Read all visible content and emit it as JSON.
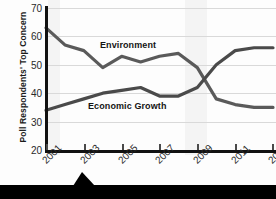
{
  "chart_data": {
    "type": "line",
    "title": "",
    "xlabel": "",
    "ylabel": "Poll Respondents' Top Concern",
    "x": [
      2001,
      2002,
      2003,
      2004,
      2005,
      2006,
      2007,
      2008,
      2009,
      2010,
      2011,
      2012,
      2013
    ],
    "xlim": [
      2001,
      2013
    ],
    "ylim": [
      20,
      70
    ],
    "yticks": [
      70,
      60,
      50,
      40,
      30,
      20
    ],
    "xticks": [
      2001,
      2003,
      2005,
      2007,
      2009,
      2011,
      2013
    ],
    "xtick_labels": [
      "2001",
      "2003",
      "2005",
      "2007",
      "2009",
      "2011",
      "2013"
    ],
    "grid": true,
    "legend": "inline-labels",
    "series": [
      {
        "name": "Environment",
        "color": "#5a5a5a",
        "values": [
          63,
          57,
          55,
          49,
          53,
          51,
          53,
          54,
          49,
          38,
          36,
          35,
          35
        ]
      },
      {
        "name": "Economic Growth",
        "color": "#4a4a4a",
        "values": [
          34,
          36,
          38,
          40,
          41,
          42,
          39,
          39,
          42,
          50,
          55,
          56,
          56
        ]
      }
    ],
    "annotations": [
      {
        "text": "Environment",
        "x": 2005,
        "y": 57
      },
      {
        "text": "Economic Growth",
        "x": 2004,
        "y": 33
      }
    ]
  },
  "axes": {
    "y_title": "Poll Respondents' Top Concern",
    "y_ticks": [
      "70",
      "60",
      "50",
      "40",
      "30",
      "20"
    ],
    "x_ticks": [
      "2001",
      "2003",
      "2005",
      "2007",
      "2009",
      "2011",
      "2013"
    ]
  },
  "labels": {
    "environment": "Environment",
    "economic_growth": "Economic Growth"
  },
  "colors": {
    "environment_line": "#5a5a5a",
    "economic_line": "#4a4a4a",
    "axis": "#111111",
    "grid": "#d9d9d9",
    "banner": "#000000"
  }
}
